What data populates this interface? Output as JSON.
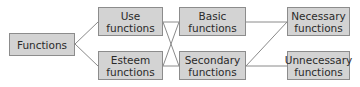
{
  "diagram": {
    "type": "hierarchy",
    "nodes": {
      "functions": {
        "label": "Functions"
      },
      "use": {
        "label": "Use\nfunctions"
      },
      "esteem": {
        "label": "Esteem\nfunctions"
      },
      "basic": {
        "label": "Basic\nfunctions"
      },
      "secondary": {
        "label": "Secondary\nfunctions"
      },
      "necessary": {
        "label": "Necessary\nfunctions"
      },
      "unnecessary": {
        "label": "Unnecessary\nfunctions"
      }
    },
    "edges": [
      [
        "functions",
        "use"
      ],
      [
        "functions",
        "esteem"
      ],
      [
        "use",
        "basic"
      ],
      [
        "use",
        "secondary"
      ],
      [
        "esteem",
        "basic"
      ],
      [
        "esteem",
        "secondary"
      ],
      [
        "basic",
        "necessary"
      ],
      [
        "secondary",
        "necessary"
      ],
      [
        "secondary",
        "unnecessary"
      ]
    ],
    "colors": {
      "node_fill": "#d3d3d3",
      "node_border": "#8c8c8c",
      "edge": "#8a8a8a",
      "text": "#2a2a2a"
    }
  }
}
